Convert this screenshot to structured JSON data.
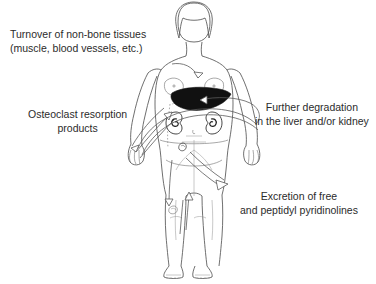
{
  "diagram": {
    "background_color": "#ffffff",
    "text_color": "#2b2b2b",
    "line_color": "#4a4a4a",
    "labels": {
      "turnover": "Turnover of non-bone tissues\n(muscle, blood vessels, etc.)",
      "osteoclast": "Osteoclast resorption\nproducts",
      "degradation": "Further degradation\nin the liver and/or kidney",
      "excretion": "Excretion of free\nand peptidyl pyridinolines"
    },
    "organs": [
      {
        "name": "liver",
        "fill": "#111111",
        "note": "solid black wedge, upper right abdomen"
      },
      {
        "name": "kidney-left",
        "fill": "#ffffff",
        "note": "bean shape with spiral hilum"
      },
      {
        "name": "kidney-right",
        "fill": "#ffffff",
        "note": "bean shape with spiral hilum"
      }
    ],
    "arrows": [
      {
        "name": "chest-to-liver",
        "from": "upper chest",
        "to": "liver",
        "direction": "down"
      },
      {
        "name": "bone-to-liver",
        "from": "left arm / skeleton",
        "to": "liver",
        "direction": "up-right"
      },
      {
        "name": "encircling-loop",
        "from": "left torso",
        "to": "right torso",
        "direction": "clockwise"
      },
      {
        "name": "pelvis-to-excretion",
        "from": "pelvis / bladder",
        "to": "excretion label",
        "direction": "down-right"
      },
      {
        "name": "leg-upward",
        "from": "lower leg",
        "to": "pelvis",
        "direction": "up"
      }
    ]
  }
}
